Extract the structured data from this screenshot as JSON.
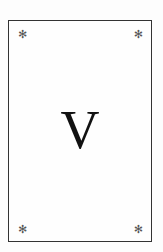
{
  "card": {
    "numeral": "V",
    "corner_symbol": "✻",
    "corners": [
      "✻",
      "✻",
      "✻",
      "✻"
    ]
  },
  "colors": {
    "border": "#333333",
    "text": "#111111",
    "corner": "#555555",
    "background": "#fdfdfd"
  }
}
